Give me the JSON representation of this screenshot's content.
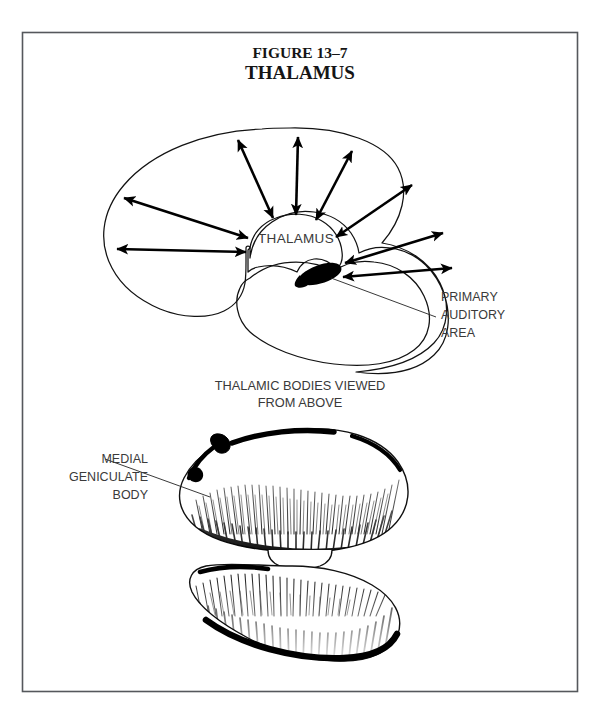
{
  "page": {
    "background_color": "#ffffff",
    "frame_color": "#55585c",
    "ink_color": "#121212",
    "label_color": "#3a3a3a",
    "width": 601,
    "height": 715
  },
  "title": {
    "figure_number": "FIGURE 13–7",
    "figure_name": "THALAMUS"
  },
  "upper_diagram": {
    "caption": "",
    "center_label": "THALAMUS",
    "callouts": [
      {
        "id": "primary-auditory-area",
        "lines": [
          "PRIMARY",
          "AUDITORY",
          "AREA"
        ]
      }
    ],
    "radiating_arrows_count": 9,
    "structures": [
      "cerebral hemisphere outline",
      "temporal lobe outline",
      "thalamus body",
      "primary auditory area"
    ]
  },
  "lower_diagram": {
    "caption_lines": [
      "THALAMIC BODIES VIEWED",
      "FROM ABOVE"
    ],
    "callouts": [
      {
        "id": "medial-geniculate-body",
        "lines": [
          "MEDIAL",
          "GENICULATE",
          "BODY"
        ]
      }
    ],
    "structures": [
      "right thalamic body",
      "left thalamic body",
      "massa intermedia"
    ]
  }
}
